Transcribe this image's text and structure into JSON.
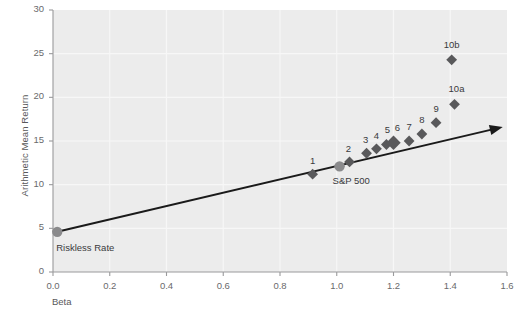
{
  "chart_data": {
    "type": "scatter",
    "title": "",
    "xlabel": "Beta",
    "ylabel": "Arithmetic Mean Return",
    "xlim": [
      0.0,
      1.6
    ],
    "ylim": [
      0,
      30
    ],
    "xticks": [
      "0.0",
      "0.2",
      "0.4",
      "0.6",
      "0.8",
      "1.0",
      "1.2",
      "1.4",
      "1.6"
    ],
    "xtick_values": [
      0.0,
      0.2,
      0.4,
      0.6,
      0.8,
      1.0,
      1.2,
      1.4,
      1.6
    ],
    "yticks": [
      "0",
      "5",
      "10",
      "15",
      "20",
      "25",
      "30"
    ],
    "ytick_values": [
      0,
      5,
      10,
      15,
      20,
      25,
      30
    ],
    "grid": true,
    "legend": "none",
    "plot_bg_color": "#ececec",
    "marker_color": "#59595b",
    "line_color": "#1a1a1a",
    "points": [
      {
        "label": "1",
        "beta": 0.915,
        "return": 11.2,
        "marker": "diamond",
        "label_dx": 0,
        "label_dy": -13
      },
      {
        "label": "2",
        "beta": 1.045,
        "return": 12.6,
        "marker": "diamond",
        "label_dx": -1,
        "label_dy": -13
      },
      {
        "label": "3",
        "beta": 1.105,
        "return": 13.6,
        "marker": "diamond",
        "label_dx": -1,
        "label_dy": -13
      },
      {
        "label": "4",
        "beta": 1.14,
        "return": 14.1,
        "marker": "diamond",
        "label_dx": 0,
        "label_dy": -13
      },
      {
        "label": "5",
        "beta": 1.175,
        "return": 14.6,
        "marker": "diamond",
        "label_dx": 1,
        "label_dy": -14
      },
      {
        "label": "6",
        "beta": 1.2,
        "return": 14.8,
        "marker": "diamond-lg",
        "label_dx": 4,
        "label_dy": -15
      },
      {
        "label": "7",
        "beta": 1.255,
        "return": 15.0,
        "marker": "diamond",
        "label_dx": 0,
        "label_dy": -14
      },
      {
        "label": "8",
        "beta": 1.3,
        "return": 15.8,
        "marker": "diamond",
        "label_dx": 0,
        "label_dy": -14
      },
      {
        "label": "9",
        "beta": 1.35,
        "return": 17.1,
        "marker": "diamond",
        "label_dx": 0,
        "label_dy": -14
      },
      {
        "label": "10a",
        "beta": 1.415,
        "return": 19.2,
        "marker": "diamond",
        "label_dx": 2,
        "label_dy": -15
      },
      {
        "label": "10b",
        "beta": 1.405,
        "return": 24.3,
        "marker": "diamond",
        "label_dx": 0,
        "label_dy": -15
      }
    ],
    "special_points": [
      {
        "name": "sp500",
        "label": "S&P 500",
        "beta": 1.01,
        "return": 12.1,
        "marker": "circle",
        "label_dx": -2,
        "label_dy": 9,
        "label_anchor": "start"
      },
      {
        "name": "riskless-rate",
        "label": "Riskless Rate",
        "beta": 0.015,
        "return": 4.6,
        "marker": "circle",
        "label_dx": 4,
        "label_dy": 10,
        "label_anchor": "start"
      }
    ],
    "sml_line": {
      "name": "security-market-line",
      "x_start": 0.015,
      "y_start": 4.6,
      "x_end": 1.585,
      "y_end": 16.6,
      "arrow": true
    }
  }
}
